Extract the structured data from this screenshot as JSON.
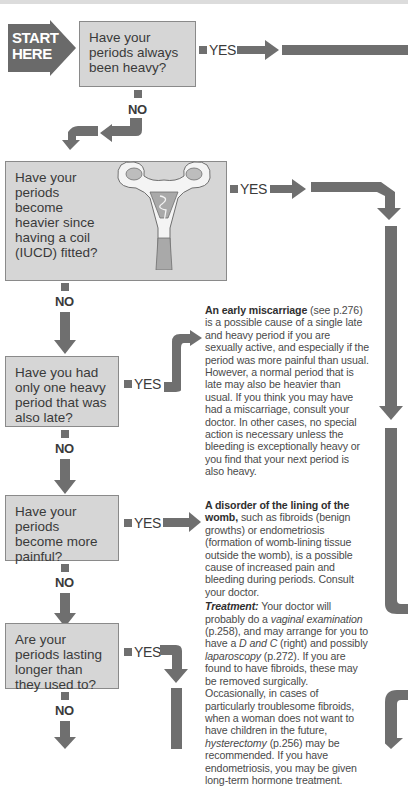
{
  "start_marker": {
    "label": "START HERE"
  },
  "questions": [
    {
      "id": "q1",
      "text": "Have your periods always been heavy?",
      "yes": "YES",
      "no": "NO"
    },
    {
      "id": "q2",
      "text": "Have your periods become heavier since having a coil (IUCD) fitted?",
      "yes": "YES",
      "no": "NO"
    },
    {
      "id": "q3",
      "text": "Have you had only one heavy period that was also late?",
      "yes": "YES",
      "no": "NO"
    },
    {
      "id": "q4",
      "text": "Have your periods become more painful?",
      "yes": "YES",
      "no": "NO"
    },
    {
      "id": "q5",
      "text": "Are your periods lasting longer than they used to?",
      "yes": "YES",
      "no": "NO"
    }
  ],
  "answers": {
    "miscarriage": {
      "title": "An early miscarriage",
      "ref": " (see p.276)",
      "body": " is a possible cause of a single late and heavy period if you are sexually active, and especially if the period was more painful than usual. However, a normal period that is late may also be heavier than usual. If you think you may have had a miscarriage, consult your doctor. In other cases, no special action is necessary unless the bleeding is exceptionally heavy or you find that your next period is also heavy."
    },
    "womb_disorder": {
      "title": "A disorder of the lining of the womb,",
      "body": " such as fibroids (benign growths) or endometriosis (formation of womb-lining tissue outside the womb), is a possible cause of increased pain and bleeding during periods. Consult your doctor.",
      "treatment_label": "Treatment:",
      "treatment_1": " Your doctor will probably do a ",
      "treatment_term_1": "vaginal examination",
      "treatment_2": " (p.258), and may arrange for you to have a ",
      "treatment_term_2": "D and C",
      "treatment_3": " (right) and possibly ",
      "treatment_term_3": "laparoscopy",
      "treatment_4": " (p.272). If you are found to have fibroids, these may be removed surgically. Occasionally, in cases of particularly troublesome fibroids, when a woman does not want to have children in the future, ",
      "treatment_term_4": "hysterectomy",
      "treatment_5": " (p.256) may be recommended. If you have endometriosis, you may be given long-term hormone treatment."
    }
  },
  "illustration": {
    "subject": "uterus-with-iucd-icon"
  },
  "colors": {
    "box_fill": "#d6d6d6",
    "arrow": "#6f6f6f",
    "start_fill": "#6a6a6a",
    "text": "#3a3a3a"
  }
}
